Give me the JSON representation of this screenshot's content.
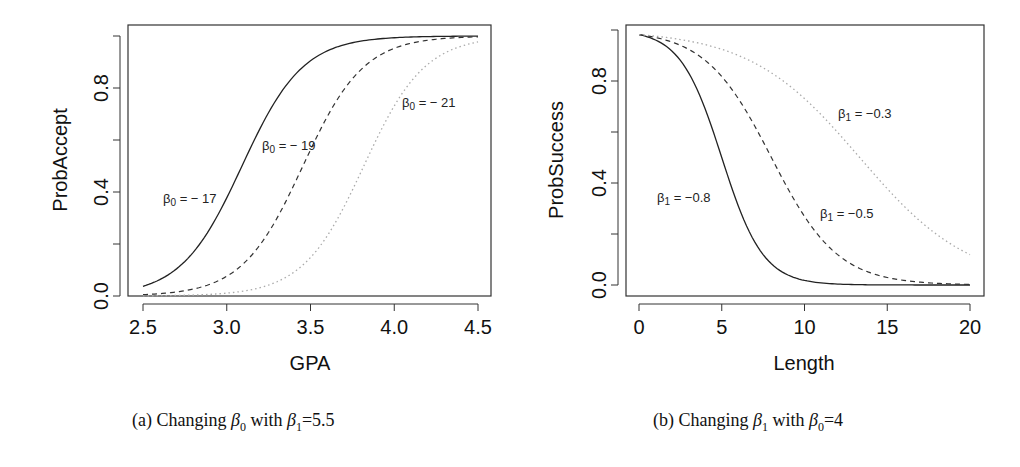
{
  "chart_data": [
    {
      "type": "line",
      "panel": "a",
      "caption": "(a) Changing β0 with β1=5.5",
      "caption_parts": {
        "prefix": "(a) Changing ",
        "var": "β",
        "var_sub": "0",
        "mid": " with ",
        "fixed": "β",
        "fixed_sub": "1",
        "fixed_val": "=5.5"
      },
      "xlabel": "GPA",
      "ylabel": "ProbAccept",
      "xlim": [
        2.5,
        4.5
      ],
      "ylim": [
        0.0,
        1.0
      ],
      "xticks": [
        "2.5",
        "3.0",
        "3.5",
        "4.0",
        "4.5"
      ],
      "yticks": [
        "0.0",
        "0.4",
        "0.8"
      ],
      "grid": false,
      "legend": "inline annotations",
      "model": "p = 1/(1+exp(-(b0 + b1*x)))",
      "b1": 5.5,
      "series": [
        {
          "name": "β0 = −17",
          "label_main": "β",
          "label_sub": "0",
          "label_val": " = − 17",
          "b0": -17,
          "style": "solid",
          "x": [
            2.5,
            2.75,
            3.0,
            3.25,
            3.5,
            3.75,
            4.0,
            4.25,
            4.5
          ],
          "values": [
            0.043,
            0.148,
            0.378,
            0.717,
            0.904,
            0.972,
            0.992,
            0.998,
            0.999
          ]
        },
        {
          "name": "β0 = −19",
          "label_main": "β",
          "label_sub": "0",
          "label_val": " = − 19",
          "b0": -19,
          "style": "dashed",
          "x": [
            2.5,
            2.75,
            3.0,
            3.25,
            3.5,
            3.75,
            4.0,
            4.25,
            4.5
          ],
          "values": [
            0.006,
            0.023,
            0.076,
            0.256,
            0.562,
            0.824,
            0.953,
            0.988,
            0.997
          ]
        },
        {
          "name": "β0 = −21",
          "label_main": "β",
          "label_sub": "0",
          "label_val": " = − 21",
          "b0": -21,
          "style": "dotted",
          "x": [
            2.5,
            2.75,
            3.0,
            3.25,
            3.5,
            3.75,
            4.0,
            4.25,
            4.5
          ],
          "values": [
            0.001,
            0.003,
            0.011,
            0.044,
            0.148,
            0.388,
            0.731,
            0.908,
            0.976
          ]
        }
      ]
    },
    {
      "type": "line",
      "panel": "b",
      "caption": "(b) Changing β1 with β0=4",
      "caption_parts": {
        "prefix": "(b) Changing ",
        "var": "β",
        "var_sub": "1",
        "mid": " with ",
        "fixed": "β",
        "fixed_sub": "0",
        "fixed_val": "=4"
      },
      "xlabel": "Length",
      "ylabel": "ProbSuccess",
      "xlim": [
        0,
        20
      ],
      "ylim": [
        0.0,
        1.0
      ],
      "xticks": [
        "0",
        "5",
        "10",
        "15",
        "20"
      ],
      "yticks": [
        "0.0",
        "0.4",
        "0.8"
      ],
      "grid": false,
      "legend": "inline annotations",
      "model": "p = 1/(1+exp(-(b0 + b1*x)))",
      "b0": 4,
      "series": [
        {
          "name": "β1 = −0.8",
          "label_main": "β",
          "label_sub": "1",
          "label_val": " = −0.8",
          "b1": -0.8,
          "style": "solid",
          "x": [
            0,
            2.5,
            5,
            7.5,
            10,
            12.5,
            15,
            17.5,
            20
          ],
          "values": [
            0.982,
            0.881,
            0.5,
            0.119,
            0.018,
            0.002,
            0.0,
            0.0,
            0.0
          ]
        },
        {
          "name": "β1 = −0.5",
          "label_main": "β",
          "label_sub": "1",
          "label_val": " = −0.5",
          "b1": -0.5,
          "style": "dashed",
          "x": [
            0,
            2.5,
            5,
            7.5,
            10,
            12.5,
            15,
            17.5,
            20
          ],
          "values": [
            0.982,
            0.944,
            0.818,
            0.562,
            0.269,
            0.095,
            0.029,
            0.009,
            0.002
          ]
        },
        {
          "name": "β1 = −0.3",
          "label_main": "β",
          "label_sub": "1",
          "label_val": " = −0.3",
          "b1": -0.3,
          "style": "dotted",
          "x": [
            0,
            2.5,
            5,
            7.5,
            10,
            12.5,
            15,
            17.5,
            20
          ],
          "values": [
            0.982,
            0.963,
            0.924,
            0.852,
            0.731,
            0.562,
            0.378,
            0.223,
            0.119
          ]
        }
      ]
    }
  ]
}
